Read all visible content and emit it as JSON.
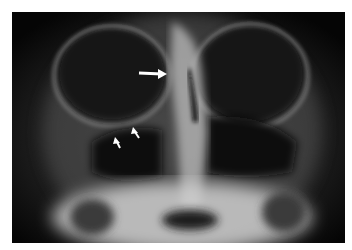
{
  "image": {
    "type": "radiograph",
    "view": "frontal",
    "background_color": "#ffffff",
    "annotations": [
      {
        "kind": "arrow",
        "size": "large",
        "direction": "right",
        "color": "#ffffff"
      },
      {
        "kind": "arrow",
        "size": "small",
        "direction": "up-left",
        "color": "#ffffff"
      },
      {
        "kind": "arrow",
        "size": "small",
        "direction": "up-left",
        "color": "#ffffff"
      }
    ]
  }
}
